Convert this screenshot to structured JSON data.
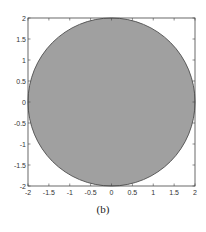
{
  "chart_data": {
    "type": "area",
    "title": "",
    "caption": "(b)",
    "xlabel": "",
    "ylabel": "",
    "xlim": [
      -2,
      2
    ],
    "ylim": [
      -2,
      2
    ],
    "grid": false,
    "legend": null,
    "x_ticks": [
      "-2",
      "-1.5",
      "-1",
      "-0.5",
      "0",
      "0.5",
      "1",
      "1.5",
      "2"
    ],
    "y_ticks": [
      "2",
      "1.5",
      "1",
      "0.5",
      "0",
      "-0.5",
      "-1",
      "-1.5",
      "-2"
    ],
    "shapes": [
      {
        "shape": "filled-circle",
        "center": [
          0,
          0
        ],
        "radius": 2,
        "fill": "#a0a0a0",
        "edge": "#555555"
      }
    ]
  },
  "colors": {
    "fill": "#a0a0a0",
    "edge": "#5a5a5a",
    "axis": "#444444",
    "background": "#ffffff"
  }
}
